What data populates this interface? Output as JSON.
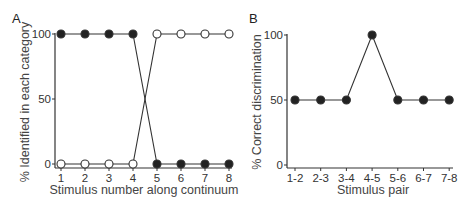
{
  "chart_data": [
    {
      "type": "line",
      "panel_label": "A",
      "xlabel": "Stimulus number along continuum",
      "ylabel": "% Identified in each category",
      "x": [
        1,
        2,
        3,
        4,
        5,
        6,
        7,
        8
      ],
      "xtick_labels": [
        "1",
        "2",
        "3",
        "4",
        "5",
        "6",
        "7",
        "8"
      ],
      "ylim": [
        0,
        100
      ],
      "yticks": [
        0,
        50,
        100
      ],
      "grid": false,
      "legend": "none",
      "series": [
        {
          "name": "Category 1",
          "marker": "filled-circle",
          "values": [
            100,
            100,
            100,
            100,
            0,
            0,
            0,
            0
          ]
        },
        {
          "name": "Category 2",
          "marker": "open-circle",
          "values": [
            0,
            0,
            0,
            0,
            100,
            100,
            100,
            100
          ]
        }
      ]
    },
    {
      "type": "line",
      "panel_label": "B",
      "xlabel": "Stimulus pair",
      "ylabel": "% Correct discrimination",
      "categories": [
        "1-2",
        "2-3",
        "3-4",
        "4-5",
        "5-6",
        "6-7",
        "7-8"
      ],
      "ylim": [
        0,
        100
      ],
      "yticks": [
        0,
        50,
        100
      ],
      "grid": false,
      "legend": "none",
      "series": [
        {
          "name": "Discrimination",
          "marker": "filled-circle",
          "values": [
            50,
            50,
            50,
            100,
            50,
            50,
            50
          ]
        }
      ]
    }
  ]
}
